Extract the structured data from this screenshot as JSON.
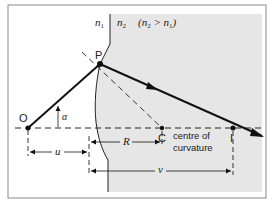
{
  "diagram": {
    "media": {
      "n1_label": "n",
      "n1_sub": "1",
      "n2_label": "n",
      "n2_sub": "2",
      "condition_open": "(n",
      "condition_sub1": "2",
      "condition_mid": " > n",
      "condition_sub2": "1",
      "condition_close": ")"
    },
    "points": {
      "object": "O",
      "incidence": "P",
      "centre": "C",
      "centre_caption_line1": "centre of",
      "centre_caption_line2": "curvature",
      "image": "I"
    },
    "angle_label": "α",
    "distances": {
      "u": "u",
      "R": "R",
      "v": "v"
    },
    "colors": {
      "medium2_fill": "#e6e6e6",
      "line": "#111111",
      "frame": "#8a8a8a"
    }
  }
}
